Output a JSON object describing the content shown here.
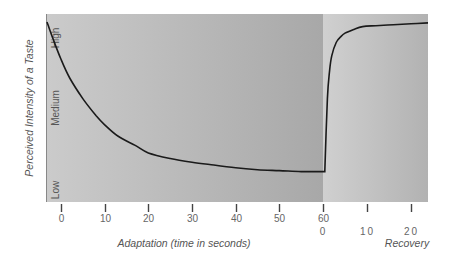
{
  "chart_data": {
    "type": "line",
    "title": "",
    "ylabel": "Perceived Intensity of a Taste",
    "y_levels": [
      "Low",
      "Medium",
      "High"
    ],
    "panels": [
      {
        "name": "Adaptation",
        "xlabel": "Adaptation (time in seconds)",
        "x_ticks": [
          0,
          10,
          20,
          30,
          40,
          50,
          60
        ],
        "xlim": [
          -3.5,
          60
        ],
        "series": [
          {
            "name": "Adaptation curve",
            "x": [
              -3.5,
              -2,
              0,
              2,
              5,
              8,
              10,
              13,
              17,
              20,
              25,
              30,
              35,
              40,
              45,
              50,
              55,
              60
            ],
            "y": [
              0.96,
              0.88,
              0.76,
              0.66,
              0.55,
              0.46,
              0.41,
              0.35,
              0.3,
              0.26,
              0.23,
              0.21,
              0.195,
              0.18,
              0.17,
              0.165,
              0.16,
              0.16
            ]
          }
        ]
      },
      {
        "name": "Recovery",
        "xlabel": "Recovery",
        "x_ticks": [
          0,
          10,
          20
        ],
        "xlim": [
          0,
          24
        ],
        "series": [
          {
            "name": "Recovery curve",
            "x": [
              0,
              0.4,
              1,
              1.5,
              2,
              3,
              4,
              5,
              7,
              9,
              12,
              16,
              20,
              24
            ],
            "y": [
              0.16,
              0.16,
              0.55,
              0.7,
              0.78,
              0.85,
              0.88,
              0.9,
              0.92,
              0.935,
              0.94,
              0.945,
              0.95,
              0.955
            ]
          }
        ]
      }
    ],
    "ylim": [
      0,
      1
    ],
    "grid": false,
    "legend": null
  },
  "labels": {
    "y_axis": "Perceived Intensity of a Taste",
    "high": "High",
    "medium": "Medium",
    "low": "Low",
    "x_axis_adaptation": "Adaptation (time in seconds)",
    "x_axis_recovery": "Recovery",
    "ticks_adaptation": [
      "0",
      "10",
      "20",
      "30",
      "40",
      "50",
      "60"
    ],
    "ticks_recovery": [
      "0",
      "10",
      "20"
    ]
  },
  "colors": {
    "panel_left_start": "#c9c9c9",
    "panel_left_end": "#a9a9a9",
    "panel_right_start": "#cdcdcd",
    "panel_right_end": "#b3b3b3",
    "curve": "#1a1a1a",
    "tick": "#444444"
  }
}
